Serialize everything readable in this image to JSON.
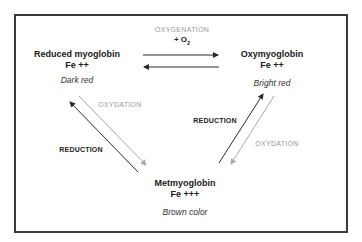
{
  "diagram": {
    "nodes": {
      "reduced": {
        "name": "Reduced myoglobin",
        "iron": "Fe ++",
        "color_label": "Dark red"
      },
      "oxy": {
        "name": "Oxymyoglobin",
        "iron": "Fe ++",
        "color_label": "Bright red"
      },
      "met": {
        "name": "Metmyoglobin",
        "iron": "Fe +++",
        "color_label": "Brown color"
      }
    },
    "edges": {
      "top": {
        "label": "OXYGENATION",
        "reagent": "+ O",
        "reagent_sub": "2"
      },
      "left_oxydation": {
        "label": "OXYDATION"
      },
      "left_reduction": {
        "label": "REDUCTION"
      },
      "right_reduction": {
        "label": "REDUCTION"
      },
      "right_oxydation": {
        "label": "OXYDATION"
      }
    },
    "colors": {
      "dark_arrow": "#2b2b2b",
      "light_arrow": "#a8a8a8",
      "gray_label": "#9a9a9a",
      "border": "#3a3a3a"
    }
  }
}
